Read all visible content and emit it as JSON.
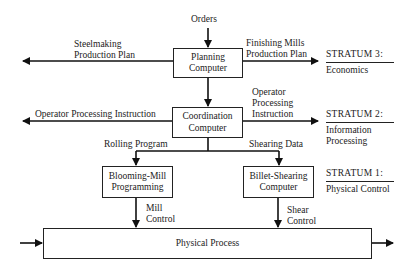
{
  "diagram": {
    "top_input": "Orders",
    "boxes": {
      "planning": [
        "Planning",
        "Computer"
      ],
      "coordination": [
        "Coordination",
        "Computer"
      ],
      "blooming": [
        "Blooming-Mill",
        "Programming"
      ],
      "billet": [
        "Billet-Shearing",
        "Computer"
      ],
      "physical": "Physical Process"
    },
    "flows": {
      "steelmaking": [
        "Steelmaking",
        "Production Plan"
      ],
      "finishing": [
        "Finishing Mills",
        "Production Plan"
      ],
      "operator_left": "Operator Processing Instruction",
      "operator_right": [
        "Operator",
        "Processing",
        "Instruction"
      ],
      "rolling": "Rolling Program",
      "shearing": "Shearing Data",
      "mill_control": [
        "Mill",
        "Control"
      ],
      "shear_control": [
        "Shear",
        "Control"
      ]
    },
    "strata": [
      {
        "title": "STRATUM 3:",
        "sub": [
          "Economics"
        ]
      },
      {
        "title": "STRATUM 2:",
        "sub": [
          "Information",
          "Processing"
        ]
      },
      {
        "title": "STRATUM 1:",
        "sub": [
          "Physical Control"
        ]
      }
    ]
  }
}
